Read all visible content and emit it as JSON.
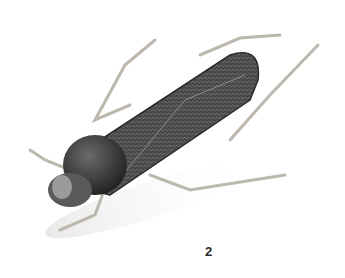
{
  "figure": {
    "label": "2"
  },
  "colors": {
    "background": "#ffffff",
    "body": "#3d3d3d",
    "head": "#2e2e2e",
    "legs": "#c8c4bc",
    "label": "#2a2a2a"
  }
}
